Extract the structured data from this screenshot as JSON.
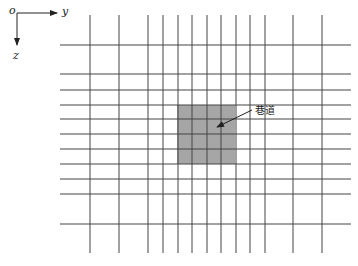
{
  "axes": {
    "origin_label": "o",
    "y_label": "y",
    "z_label": "z"
  },
  "grid": {
    "vertical_x": [
      90,
      119,
      148,
      163,
      178,
      192,
      207,
      221,
      236,
      250,
      265,
      293,
      322
    ],
    "horizontal_y": [
      45,
      74,
      90,
      105,
      119,
      134,
      149,
      164,
      179,
      194,
      224
    ],
    "v_top": 15,
    "v_bottom": 253,
    "h_left": 60,
    "h_right": 351,
    "line_color": "#444444"
  },
  "tunnel": {
    "label": "巷道",
    "x": 177,
    "y": 105,
    "width": 58,
    "height": 59,
    "fill": "#a6a6a6"
  }
}
